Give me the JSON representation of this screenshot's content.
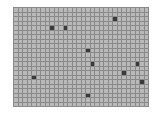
{
  "grid": {
    "cols": 30,
    "rows": 22,
    "cell_px": 3.5,
    "colors": {
      "empty": "#b9b9b9",
      "filled": "#3a3a3a",
      "line": "#8a8a8a"
    },
    "filled_cells": [
      {
        "col": 8,
        "row": 4
      },
      {
        "col": 11,
        "row": 4
      },
      {
        "col": 22,
        "row": 2
      },
      {
        "col": 16,
        "row": 9
      },
      {
        "col": 17,
        "row": 12
      },
      {
        "col": 27,
        "row": 12
      },
      {
        "col": 24,
        "row": 14
      },
      {
        "col": 28,
        "row": 16
      },
      {
        "col": 4,
        "row": 15
      },
      {
        "col": 16,
        "row": 19
      }
    ]
  }
}
